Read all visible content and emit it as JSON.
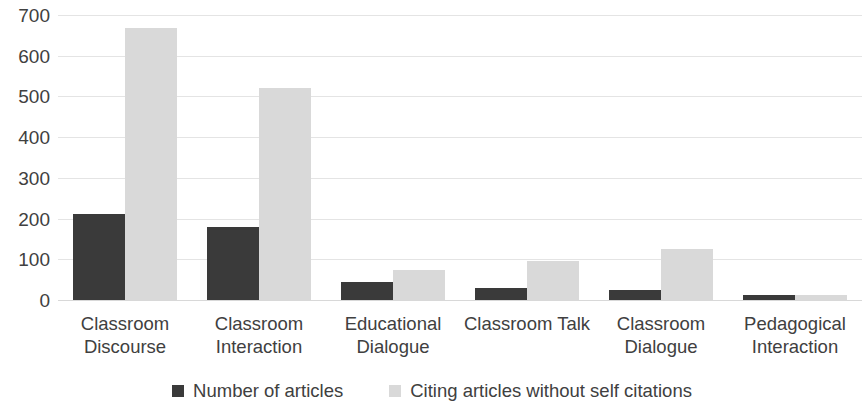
{
  "chart_data": {
    "type": "bar",
    "title": "",
    "subtitle": "",
    "xlabel": "",
    "ylabel": "",
    "ylim": [
      0,
      700
    ],
    "ytick_step": 100,
    "yticks": [
      700,
      600,
      500,
      400,
      300,
      200,
      100,
      0
    ],
    "grid": true,
    "grid_axis": "y",
    "legend_position": "bottom-center",
    "categories": [
      "Classroom Discourse",
      "Classroom Interaction",
      "Educational Dialogue",
      "Classroom Talk",
      "Classroom Dialogue",
      "Pedagogical Interaction"
    ],
    "category_label_lines": [
      [
        "Classroom",
        "Discourse"
      ],
      [
        "Classroom",
        "Interaction"
      ],
      [
        "Educational",
        "Dialogue"
      ],
      [
        "Classroom Talk"
      ],
      [
        "Classroom",
        "Dialogue"
      ],
      [
        "Pedagogical",
        "Interaction"
      ]
    ],
    "series": [
      {
        "name": "Number of articles",
        "color": "#3a3a3a",
        "values": [
          212,
          180,
          45,
          30,
          25,
          12
        ]
      },
      {
        "name": "Citing articles without self citations",
        "color": "#d9d9d9",
        "values": [
          668,
          520,
          73,
          95,
          125,
          13
        ]
      }
    ]
  },
  "axis": {
    "ticks": [
      {
        "label": "700",
        "value": 700
      },
      {
        "label": "600",
        "value": 600
      },
      {
        "label": "500",
        "value": 500
      },
      {
        "label": "400",
        "value": 400
      },
      {
        "label": "300",
        "value": 300
      },
      {
        "label": "200",
        "value": 200
      },
      {
        "label": "100",
        "value": 100
      },
      {
        "label": "0",
        "value": 0
      }
    ]
  },
  "legend": {
    "items": [
      {
        "label": "Number of articles",
        "color": "#3a3a3a"
      },
      {
        "label": "Citing articles without self citations",
        "color": "#d9d9d9"
      }
    ]
  },
  "colors": {
    "series_dark": "#3a3a3a",
    "series_light": "#d9d9d9",
    "gridline": "#e4e4e4",
    "text": "#404040",
    "background": "#ffffff"
  }
}
